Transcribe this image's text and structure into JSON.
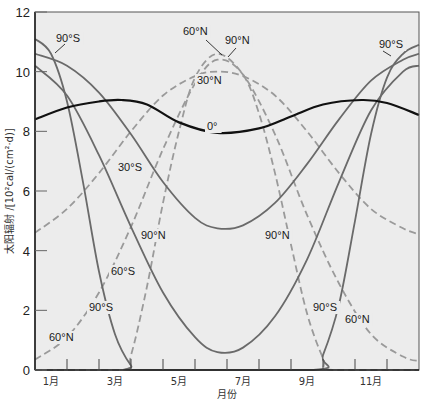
{
  "chart_data": {
    "type": "line",
    "title": "",
    "xlabel": "月份",
    "ylabel": "太阳辐射 /[10²cal/(cm²·d)]",
    "ylim": [
      0,
      12
    ],
    "xlim": [
      0,
      12
    ],
    "yticks": [
      0,
      2,
      4,
      6,
      8,
      10,
      12
    ],
    "xtick_labels": [
      "1月",
      "3月",
      "5月",
      "7月",
      "9月",
      "11月"
    ],
    "grid": false,
    "legend": "inline annotations",
    "x_unit": "months since Jan 1",
    "series": [
      {
        "name": "0°",
        "style": "solid-black",
        "color": "#111111",
        "x": [
          0,
          1,
          2,
          2.7,
          3.5,
          4.5,
          5.7,
          7,
          8,
          9,
          10.2,
          11,
          12
        ],
        "values": [
          8.4,
          8.8,
          9.0,
          9.05,
          8.9,
          8.3,
          7.95,
          8.1,
          8.5,
          8.9,
          9.05,
          8.95,
          8.55
        ]
      },
      {
        "name": "30°S",
        "style": "solid-gray",
        "color": "#6a6a6a",
        "x": [
          0,
          1,
          2,
          3,
          4,
          5,
          5.7,
          6.5,
          7.5,
          8.5,
          9.5,
          10.5,
          11.5,
          12
        ],
        "values": [
          10.6,
          10.2,
          9.3,
          7.9,
          6.3,
          5.1,
          4.75,
          4.85,
          5.6,
          6.9,
          8.4,
          9.7,
          10.4,
          10.6
        ]
      },
      {
        "name": "60°S",
        "style": "solid-gray",
        "color": "#6a6a6a",
        "x": [
          0,
          1,
          2,
          3,
          4,
          5,
          5.7,
          6.5,
          7.5,
          8.5,
          9.5,
          10.5,
          11.5,
          12
        ],
        "values": [
          10.2,
          9.2,
          7.2,
          4.8,
          2.6,
          1.1,
          0.6,
          0.75,
          1.8,
          3.7,
          6.3,
          8.7,
          10.0,
          10.2
        ]
      },
      {
        "name": "90°S",
        "style": "solid-gray",
        "color": "#6a6a6a",
        "x": [
          0,
          0.5,
          1,
          1.5,
          2,
          2.5,
          3,
          3.3,
          8.7,
          9,
          9.5,
          10,
          10.5,
          11,
          11.5,
          12
        ],
        "values": [
          11.1,
          10.6,
          9.0,
          6.3,
          3.3,
          1.2,
          0.15,
          0,
          0,
          0.5,
          2.2,
          5.0,
          7.9,
          9.8,
          10.6,
          10.9
        ]
      },
      {
        "name": "30°N",
        "style": "dashed-gray",
        "color": "#9a9a9a",
        "x": [
          0,
          1,
          2,
          3,
          4,
          5,
          5.7,
          6.5,
          7.5,
          8.5,
          9.5,
          10.5,
          11.5,
          12
        ],
        "values": [
          4.6,
          5.4,
          6.6,
          8.0,
          9.2,
          9.85,
          10.0,
          9.85,
          9.2,
          8.0,
          6.6,
          5.4,
          4.75,
          4.55
        ]
      },
      {
        "name": "60°N",
        "style": "dashed-gray",
        "color": "#9a9a9a",
        "x": [
          0,
          1,
          2,
          3,
          4,
          5,
          5.7,
          6.5,
          7.5,
          8.5,
          9.5,
          10.5,
          11.5,
          12
        ],
        "values": [
          0.35,
          1.1,
          2.6,
          4.8,
          7.4,
          9.6,
          10.4,
          9.9,
          7.9,
          5.2,
          2.9,
          1.2,
          0.45,
          0.3
        ]
      },
      {
        "name": "90°N",
        "style": "dashed-gray",
        "color": "#9a9a9a",
        "x": [
          0,
          2.7,
          3,
          3.5,
          4,
          4.5,
          5,
          5.7,
          6.5,
          7,
          7.5,
          8,
          8.5,
          9,
          9.3,
          12
        ],
        "values": [
          0,
          0,
          0.5,
          2.8,
          5.6,
          8.0,
          9.8,
          10.6,
          9.9,
          8.6,
          6.6,
          4.2,
          1.9,
          0.4,
          0,
          0
        ]
      }
    ],
    "annotations": [
      {
        "text": "90°S",
        "x_px": 56,
        "y_px": 42
      },
      {
        "text": "60°N",
        "x_px": 183,
        "y_px": 35
      },
      {
        "text": "90°N",
        "x_px": 225,
        "y_px": 44
      },
      {
        "text": "30°N",
        "x_px": 197,
        "y_px": 84
      },
      {
        "text": "0°",
        "x_px": 207,
        "y_px": 130
      },
      {
        "text": "30°S",
        "x_px": 118,
        "y_px": 171
      },
      {
        "text": "90°N",
        "x_px": 141,
        "y_px": 239
      },
      {
        "text": "90°N",
        "x_px": 265,
        "y_px": 239
      },
      {
        "text": "60°S",
        "x_px": 111,
        "y_px": 275
      },
      {
        "text": "90°S",
        "x_px": 89,
        "y_px": 311
      },
      {
        "text": "60°N",
        "x_px": 49,
        "y_px": 341
      },
      {
        "text": "90°S",
        "x_px": 313,
        "y_px": 311
      },
      {
        "text": "60°N",
        "x_px": 345,
        "y_px": 323
      },
      {
        "text": "90°S",
        "x_px": 379,
        "y_px": 48
      }
    ]
  },
  "colors": {
    "background": "#ffffff",
    "plot_bg": "#ececec",
    "axis": "#333333",
    "equator": "#111111",
    "south": "#6a6a6a",
    "north": "#9a9a9a"
  }
}
